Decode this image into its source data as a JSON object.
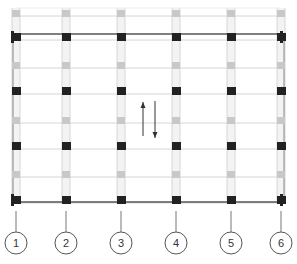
{
  "diagram": {
    "type": "structural-grid-plan",
    "colors": {
      "gridline": "#d6d6d6",
      "column_strip": "#e4e4e4",
      "outer_wall": "#555555",
      "column_black": "#222222",
      "column_gray": "#c8c8c8",
      "arrow": "#333333",
      "axis_circle": "#555555"
    },
    "axis_labels": [
      "1",
      "2",
      "3",
      "4",
      "5",
      "6"
    ],
    "axis_x": [
      16,
      66,
      121,
      176,
      231,
      281
    ],
    "rows_black": [
      37,
      91,
      146,
      200
    ],
    "rows_gray": [
      13,
      65,
      120,
      174
    ],
    "outer_top_y": 34,
    "outer_bottom_y": 202,
    "bubble_y": 243,
    "bubble_r": 11,
    "arrows": [
      {
        "direction": "up",
        "x": 143,
        "y1": 136,
        "y2": 102
      },
      {
        "direction": "down",
        "x": 155,
        "y1": 101,
        "y2": 138
      }
    ]
  }
}
